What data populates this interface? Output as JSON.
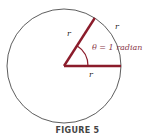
{
  "figure": {
    "caption": "FIGURE 5",
    "labels": {
      "radius_left": "r",
      "arc": "r",
      "radius_bottom": "r",
      "angle": "θ = 1 radian"
    },
    "colors": {
      "circle": "#333333",
      "radius_lines": "#8b1c2b",
      "angle_label": "#8b3a4a"
    },
    "geometry": {
      "center": [
        64,
        66
      ],
      "radius": 57,
      "angle_radians": 1
    }
  }
}
